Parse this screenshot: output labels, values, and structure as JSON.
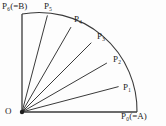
{
  "figure": {
    "name": "quarter-circle-equal-subdivision",
    "background_color": "#fdfdfd",
    "stroke_color": "#3a3a3a",
    "text_color": "#1d1d1d",
    "origin_label": "O",
    "radius_px": 98,
    "sector_start_angle_deg": 0,
    "sector_end_angle_deg": 90,
    "divisions": 6,
    "step_angle_deg": 15,
    "center": {
      "x": 22,
      "y": 112
    },
    "points": [
      {
        "id": "P0",
        "base": "P",
        "subscript": "0",
        "alias": "(=A)",
        "label": "P₀(=A)",
        "angle_deg": 0,
        "x": 137,
        "y": 112,
        "label_x": 122,
        "label_y": 113,
        "has_radial_line": true
      },
      {
        "id": "P1",
        "base": "P",
        "subscript": "1",
        "alias": "",
        "label": "P₁",
        "angle_deg": 15,
        "x": 118.6,
        "y": 86.6,
        "label_x": 124,
        "label_y": 84,
        "has_radial_line": true
      },
      {
        "id": "P2",
        "base": "P",
        "subscript": "2",
        "alias": "",
        "label": "P₂",
        "angle_deg": 30,
        "x": 106.9,
        "y": 63.0,
        "label_x": 114,
        "label_y": 56,
        "has_radial_line": true
      },
      {
        "id": "P3",
        "base": "P",
        "subscript": "3",
        "alias": "",
        "label": "P₃",
        "angle_deg": 45,
        "x": 91.3,
        "y": 42.7,
        "label_x": 98,
        "label_y": 33,
        "has_radial_line": true
      },
      {
        "id": "P4",
        "base": "P",
        "subscript": "4",
        "alias": "",
        "label": "P₄",
        "angle_deg": 60,
        "x": 71.0,
        "y": 27.1,
        "label_x": 75,
        "label_y": 16,
        "has_radial_line": true
      },
      {
        "id": "P5",
        "base": "P",
        "subscript": "5",
        "alias": "",
        "label": "P₅",
        "angle_deg": 75,
        "x": 47.4,
        "y": 15.4,
        "label_x": 45,
        "label_y": 3,
        "has_radial_line": true
      },
      {
        "id": "P6",
        "base": "P",
        "subscript": "6",
        "alias": "(=B)",
        "label": "P₆(=B)",
        "angle_deg": 90,
        "x": 22,
        "y": 14,
        "label_x": 2,
        "label_y": 3,
        "has_radial_line": true
      }
    ],
    "origin": {
      "label": "O",
      "label_x": 5,
      "label_y": 108,
      "dot_radius": 2
    },
    "arc": {
      "description": "quarter circle arc from P0 to P6",
      "stroke_width": 1.1
    }
  }
}
